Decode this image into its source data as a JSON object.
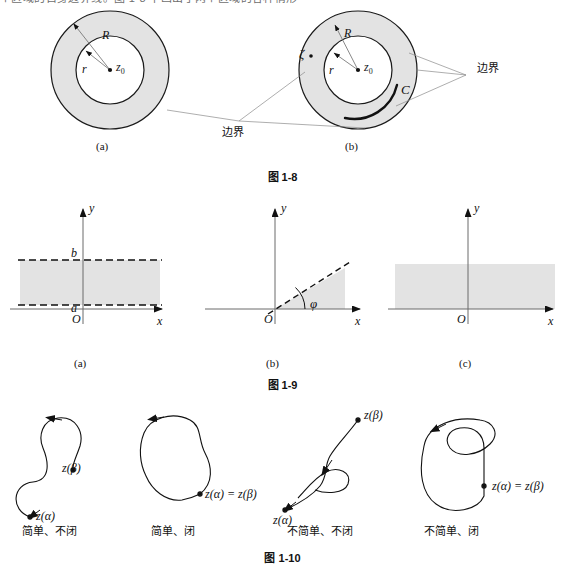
{
  "page": {
    "top_text_fragment": "个区域的自身边界线。图 1-8 中画出了两个区域的各种情形"
  },
  "figures": [
    {
      "id": "fig-1-8",
      "caption": "图 1-8",
      "panels": [
        {
          "key": "a",
          "sublabel": "(a)",
          "labels": {
            "outer_radius": "R",
            "inner_radius": "r",
            "center": "z",
            "center_sub": "0"
          }
        },
        {
          "key": "b",
          "sublabel": "(b)",
          "labels": {
            "outer_radius": "R",
            "inner_radius": "r",
            "center": "z",
            "center_sub": "0",
            "point": "ζ",
            "curve": "C"
          }
        }
      ],
      "annotations": {
        "boundary_left": "边界",
        "boundary_right": "边界"
      }
    },
    {
      "id": "fig-1-9",
      "caption": "图 1-9",
      "panels": [
        {
          "key": "a",
          "sublabel": "(a)",
          "axis_x": "x",
          "axis_y": "y",
          "origin": "O",
          "tick_upper": "b",
          "tick_lower": "a"
        },
        {
          "key": "b",
          "sublabel": "(b)",
          "axis_x": "x",
          "axis_y": "y",
          "origin": "O",
          "angle": "φ"
        },
        {
          "key": "c",
          "sublabel": "(c)",
          "axis_x": "x",
          "axis_y": "y",
          "origin": "O"
        }
      ]
    },
    {
      "id": "fig-1-10",
      "caption": "图 1-10",
      "panels": [
        {
          "key": "simple-open",
          "endpoint_start": "z(α)",
          "endpoint_end": "z(β)",
          "label": "简单、不闭"
        },
        {
          "key": "simple-closed",
          "endpoint_joint": "z(α) = z(β)",
          "label": "简单、闭"
        },
        {
          "key": "nonsimple-open",
          "endpoint_start": "z(α)",
          "endpoint_end": "z(β)",
          "label": "不简单、不闭"
        },
        {
          "key": "nonsimple-closed",
          "endpoint_joint": "z(α) = z(β)",
          "label": "不简单、闭"
        }
      ]
    }
  ],
  "colors": {
    "shade": "#e3e3e3",
    "stroke": "#1a1a1a",
    "leader": "#8b8b8b",
    "axis": "#6b6b6b"
  }
}
